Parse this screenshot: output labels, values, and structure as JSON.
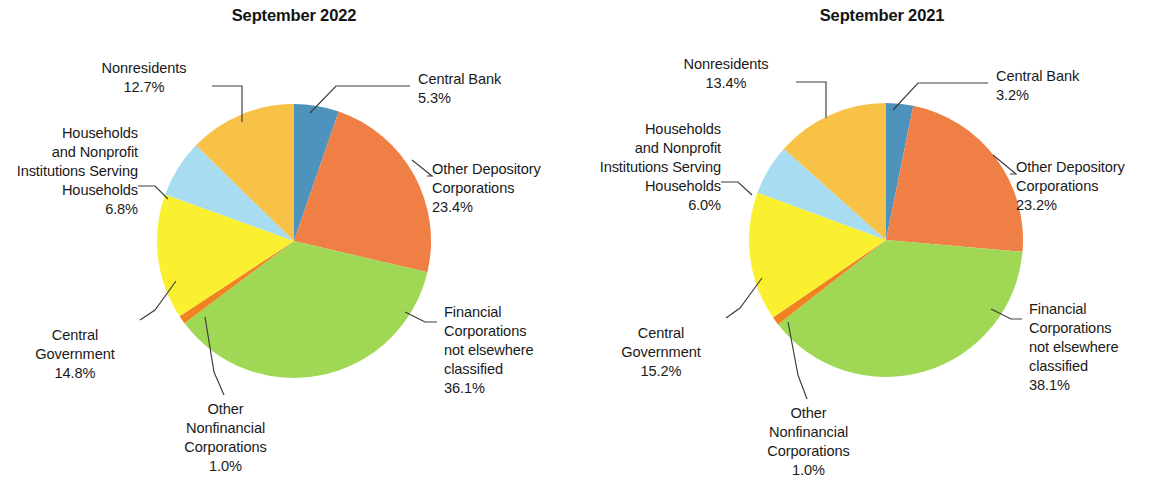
{
  "chart_data": [
    {
      "type": "pie",
      "title": "September 2022",
      "categories": [
        "Central Bank",
        "Other Depository Corporations",
        "Financial Corporations not elsewhere classified",
        "Other Nonfinancial Corporations",
        "Central Government",
        "Households and Nonprofit Institutions Serving Households",
        "Nonresidents"
      ],
      "values": [
        5.3,
        23.4,
        36.1,
        1.0,
        14.8,
        6.8,
        12.7
      ],
      "value_labels": [
        "5.3%",
        "23.4%",
        "36.1%",
        "1.0%",
        "14.8%",
        "6.8%",
        "12.7%"
      ],
      "colors": [
        "#4d93bd",
        "#ef7f45",
        "#a0d755",
        "#f0821f",
        "#faf030",
        "#a8dcf0",
        "#f8c246"
      ],
      "start_angle_deg": 0,
      "direction": "clockwise",
      "legend": "none",
      "grid": false,
      "labels": "leader-line callouts"
    },
    {
      "type": "pie",
      "title": "September 2021",
      "categories": [
        "Central Bank",
        "Other Depository Corporations",
        "Financial Corporations not elsewhere classified",
        "Other Nonfinancial Corporations",
        "Central Government",
        "Households and Nonprofit Institutions Serving Households",
        "Nonresidents"
      ],
      "values": [
        3.2,
        23.2,
        38.1,
        1.0,
        15.2,
        6.0,
        13.4
      ],
      "value_labels": [
        "3.2%",
        "23.2%",
        "38.1%",
        "1.0%",
        "15.2%",
        "6.0%",
        "13.4%"
      ],
      "colors": [
        "#4d93bd",
        "#ef7f45",
        "#a0d755",
        "#f0821f",
        "#faf030",
        "#a8dcf0",
        "#f8c246"
      ],
      "start_angle_deg": 0,
      "direction": "clockwise",
      "legend": "none",
      "grid": false,
      "labels": "leader-line callouts"
    }
  ],
  "panels": [
    {
      "title": "September 2022",
      "callouts": {
        "central_bank": "Central Bank\n5.3%",
        "other_depository": "Other Depository\nCorporations\n23.4%",
        "financial_nec": "Financial\nCorporations\nnot elsewhere\nclassified\n36.1%",
        "other_nonfinancial": "Other\nNonfinancial\nCorporations\n1.0%",
        "central_government": "Central\nGovernment\n14.8%",
        "households_npish": "Households\nand Nonprofit\nInstitutions Serving\nHouseholds\n6.8%",
        "nonresidents": "Nonresidents\n12.7%"
      }
    },
    {
      "title": "September 2021",
      "callouts": {
        "central_bank": "Central Bank\n3.2%",
        "other_depository": "Other Depository\nCorporations\n23.2%",
        "financial_nec": "Financial\nCorporations\nnot elsewhere\nclassified\n38.1%",
        "other_nonfinancial": "Other\nNonfinancial\nCorporations\n1.0%",
        "central_government": "Central\nGovernment\n15.2%",
        "households_npish": "Households\nand Nonprofit\nInstitutions Serving\nHouseholds\n6.0%",
        "nonresidents": "Nonresidents\n13.4%"
      }
    }
  ]
}
